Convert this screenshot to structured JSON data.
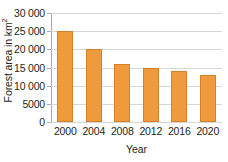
{
  "chart_data": {
    "type": "bar",
    "title": "",
    "subtitle": "",
    "xlabel": "Year",
    "ylabel": "Forest area in km²",
    "ylabel_main": "Forest area in km",
    "ylabel_exponent": "2",
    "categories": [
      "2000",
      "2004",
      "2008",
      "2012",
      "2016",
      "2020"
    ],
    "values": [
      25000,
      20000,
      16000,
      15000,
      14000,
      13000
    ],
    "ylim": [
      0,
      30000
    ],
    "ytick_values": [
      0,
      5000,
      10000,
      15000,
      20000,
      25000,
      30000
    ],
    "ytick_labels": [
      "0",
      "5000",
      "10 000",
      "15 000",
      "20 000",
      "25 000",
      "30 000"
    ],
    "grid": "horizontal",
    "legend": "none",
    "bar_color": "#f09a3e",
    "bar_border_color": "#d4812a",
    "gridline_color": "#d6d6d6",
    "axis_color": "#a9a9a9",
    "text_color": "#231f20",
    "background": "#ffffff"
  }
}
